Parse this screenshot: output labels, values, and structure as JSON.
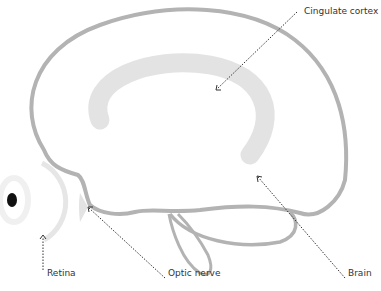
{
  "diagram": {
    "type": "brain-lateral-section",
    "labels": [
      {
        "id": "cingulate",
        "text": "Cingulate cortex"
      },
      {
        "id": "retina",
        "text": "Retina"
      },
      {
        "id": "optic",
        "text": "Optic nerve"
      },
      {
        "id": "brain",
        "text": "Brain"
      }
    ],
    "colors": {
      "outline": "#b3b3b3",
      "cingulate_fill": "#e3e3e3",
      "leader": "#333333",
      "text": "#333333"
    }
  }
}
